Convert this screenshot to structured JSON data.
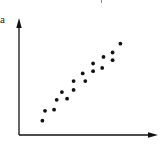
{
  "chart_data": {
    "type": "scatter",
    "title": "",
    "panel_label": "a",
    "xlabel": "",
    "ylabel": "",
    "grid": false,
    "legend": null,
    "axes": {
      "x_arrow": true,
      "y_arrow": true,
      "ticks": false
    },
    "xlim": [
      0,
      10
    ],
    "ylim": [
      0,
      10
    ],
    "points": [
      {
        "x": 1.8,
        "y": 1.3
      },
      {
        "x": 2.0,
        "y": 2.2
      },
      {
        "x": 2.7,
        "y": 2.3
      },
      {
        "x": 2.9,
        "y": 3.2
      },
      {
        "x": 3.3,
        "y": 3.9
      },
      {
        "x": 3.7,
        "y": 3.3
      },
      {
        "x": 4.2,
        "y": 4.9
      },
      {
        "x": 4.2,
        "y": 4.1
      },
      {
        "x": 4.9,
        "y": 5.6
      },
      {
        "x": 5.1,
        "y": 4.9
      },
      {
        "x": 5.7,
        "y": 6.5
      },
      {
        "x": 5.7,
        "y": 5.8
      },
      {
        "x": 6.4,
        "y": 6.1
      },
      {
        "x": 6.5,
        "y": 7.1
      },
      {
        "x": 7.2,
        "y": 7.5
      },
      {
        "x": 7.2,
        "y": 6.8
      },
      {
        "x": 7.8,
        "y": 8.3
      }
    ],
    "trend": "strong positive linear correlation"
  },
  "colors": {
    "axis": "#111111",
    "point": "#111111",
    "background": "#ffffff"
  }
}
